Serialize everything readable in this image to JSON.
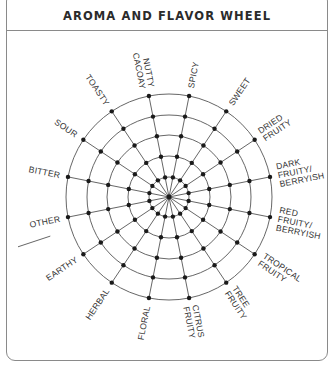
{
  "header": {
    "title": "AROMA AND FLAVOR WHEEL"
  },
  "wheel": {
    "center": [
      169,
      197
    ],
    "ring_radii": [
      20,
      41,
      62,
      82,
      103
    ],
    "spoke_count": 16,
    "spoke_offset_deg": 11.25,
    "line_color": "#555555",
    "dot_color": "#1a1a1a",
    "labels": [
      {
        "lines": [
          "NUTTY",
          "CACOAY"
        ],
        "angle": -11.25
      },
      {
        "lines": [
          "SPICY"
        ],
        "angle": 11.25
      },
      {
        "lines": [
          "SWEET"
        ],
        "angle": 33.75
      },
      {
        "lines": [
          "DRIED",
          "FRUITY"
        ],
        "angle": 56.25
      },
      {
        "lines": [
          "DARK",
          "FRUITY/",
          "BERRYISH"
        ],
        "angle": 78.75
      },
      {
        "lines": [
          "RED",
          "FRUITY/",
          "BERRYISH"
        ],
        "angle": 101.25
      },
      {
        "lines": [
          "TROPICAL",
          "FRUITY"
        ],
        "angle": 123.75
      },
      {
        "lines": [
          "TREE",
          "FRUITY"
        ],
        "angle": 146.25
      },
      {
        "lines": [
          "CITRUS",
          "FRUITY"
        ],
        "angle": 168.75
      },
      {
        "lines": [
          "FLORAL"
        ],
        "angle": 191.25
      },
      {
        "lines": [
          "HERBAL"
        ],
        "angle": 213.75
      },
      {
        "lines": [
          "EARTHY"
        ],
        "angle": 236.25
      },
      {
        "lines": [
          "OTHER"
        ],
        "angle": 258.75,
        "write_in_line": true
      },
      {
        "lines": [
          "BITTER"
        ],
        "angle": 281.25
      },
      {
        "lines": [
          "SOUR"
        ],
        "angle": 303.75
      },
      {
        "lines": [
          "TOASTY"
        ],
        "angle": 326.25
      }
    ]
  }
}
